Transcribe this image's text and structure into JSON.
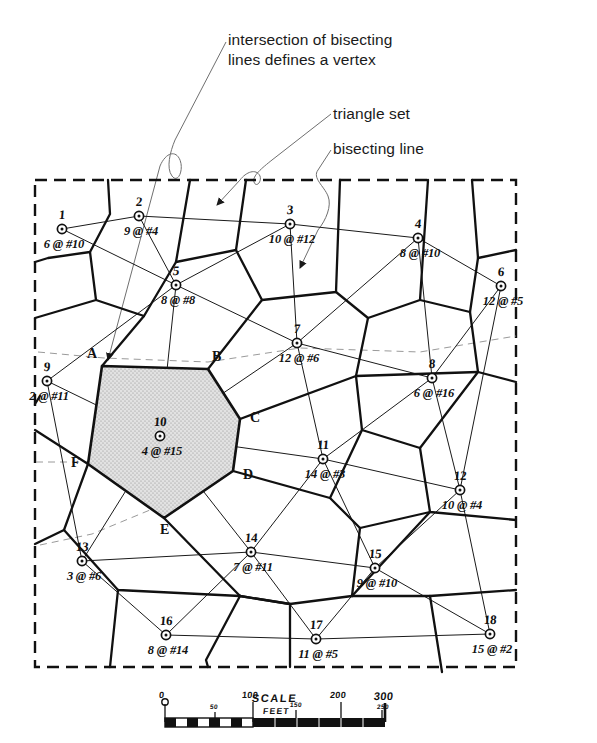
{
  "figure": {
    "type": "voronoi-thiessen-network-map",
    "background": "#ffffff",
    "ink": "#111111",
    "shade_fill": "#d9d9d9"
  },
  "annotations": [
    {
      "id": "vertex",
      "text": "intersection of bisecting\nlines defines a vertex"
    },
    {
      "id": "triangle",
      "text": "triangle set"
    },
    {
      "id": "bisecting",
      "text": "bisecting line"
    }
  ],
  "polygon": {
    "name": "shaded-thiessen-polygon",
    "center_node": "10",
    "vertex_labels": [
      "A",
      "B",
      "C",
      "D",
      "E",
      "F"
    ],
    "vertices": [
      {
        "label": "A",
        "x": 102,
        "y": 366
      },
      {
        "label": "B",
        "x": 208,
        "y": 369
      },
      {
        "label": "C",
        "x": 240,
        "y": 419
      },
      {
        "label": "D",
        "x": 233,
        "y": 471
      },
      {
        "label": "E",
        "x": 164,
        "y": 518
      },
      {
        "label": "F",
        "x": 88,
        "y": 464
      }
    ]
  },
  "nodes": [
    {
      "id": "1",
      "label": "1",
      "value": "6 @ #10",
      "x": 62,
      "y": 229
    },
    {
      "id": "2",
      "label": "2",
      "value": "9 @ #4",
      "x": 139,
      "y": 216
    },
    {
      "id": "3",
      "label": "3",
      "value": "10 @ #12",
      "x": 290,
      "y": 224
    },
    {
      "id": "4",
      "label": "4",
      "value": "8 @ #10",
      "x": 418,
      "y": 238
    },
    {
      "id": "5",
      "label": "5",
      "value": "8 @ #8",
      "x": 176,
      "y": 285
    },
    {
      "id": "6",
      "label": "6",
      "value": "12 @ #5",
      "x": 501,
      "y": 286
    },
    {
      "id": "7",
      "label": "7",
      "value": "12 @ #6",
      "x": 297,
      "y": 343
    },
    {
      "id": "8",
      "label": "8",
      "value": "6 @ #16",
      "x": 432,
      "y": 378
    },
    {
      "id": "9",
      "label": "9",
      "value": "2 @ #11",
      "x": 47,
      "y": 381
    },
    {
      "id": "10",
      "label": "10",
      "value": "4 @ #15",
      "x": 160,
      "y": 436
    },
    {
      "id": "11",
      "label": "11",
      "value": "14 @ #3",
      "x": 323,
      "y": 459
    },
    {
      "id": "12",
      "label": "12",
      "value": "10 @ #4",
      "x": 460,
      "y": 490
    },
    {
      "id": "13",
      "label": "13",
      "value": "3 @ #6",
      "x": 82,
      "y": 561
    },
    {
      "id": "14",
      "label": "14",
      "value": "7 @ #11",
      "x": 251,
      "y": 552
    },
    {
      "id": "15",
      "label": "15",
      "value": "9 @ #10",
      "x": 375,
      "y": 568
    },
    {
      "id": "16",
      "label": "16",
      "value": "8 @ #14",
      "x": 166,
      "y": 635
    },
    {
      "id": "17",
      "label": "17",
      "value": "11 @ #5",
      "x": 316,
      "y": 639
    },
    {
      "id": "18",
      "label": "18",
      "value": "15 @ #2",
      "x": 490,
      "y": 634
    }
  ],
  "scale": {
    "title": "SCALE",
    "units": "FEET",
    "major_ticks": [
      "0",
      "100",
      "200",
      "300"
    ],
    "minor_ticks": [
      "50",
      "150",
      "250"
    ]
  }
}
